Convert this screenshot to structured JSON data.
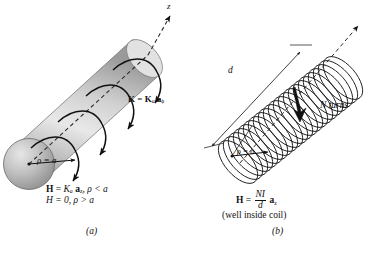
{
  "figure": {
    "background_color": "#ffffff",
    "ink_color": "#111111"
  },
  "panel_a": {
    "caption": "(a)",
    "axis_label": "z",
    "surface_current_label": "K = K",
    "surface_current_sub": "a",
    "surface_current_vec": "a",
    "surface_current_vec_sub": "ϕ",
    "radius_label": "ρ = a",
    "equation_line1_lhs": "H",
    "equation_line1_eq": " = ",
    "equation_line1_K": "K",
    "equation_line1_Ksub": "a",
    "equation_line1_vec": "a",
    "equation_line1_vecsub": "z",
    "equation_line1_cond": ", ρ < a",
    "equation_line2": "H = 0, ρ > a",
    "arrow_count": 4,
    "cylinder_fill_light": "#f2f2f2",
    "cylinder_fill_mid": "#c9c9c9",
    "cylinder_fill_dark": "#8f8f8f"
  },
  "panel_b": {
    "caption": "(b)",
    "length_label": "d",
    "turns_label": "N turns",
    "radius_label": "ρ = a",
    "equation_lhs": "H",
    "equation_eq": " = ",
    "equation_numerator": "NI",
    "equation_denominator": "d",
    "equation_vec": "a",
    "equation_vec_sub": "z",
    "note": "(well inside coil)",
    "coil_turns_drawn": 22
  }
}
